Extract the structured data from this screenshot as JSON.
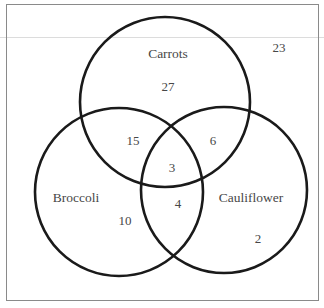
{
  "diagram": {
    "type": "venn",
    "sets": [
      {
        "name": "Carrots",
        "label": "Carrots"
      },
      {
        "name": "Broccoli",
        "label": "Broccoli"
      },
      {
        "name": "Cauliflower",
        "label": "Cauliflower"
      }
    ],
    "regions": {
      "carrots_only": "27",
      "broccoli_only": "10",
      "cauliflower_only": "2",
      "carrots_broccoli": "15",
      "carrots_cauliflower": "6",
      "broccoli_cauliflower": "4",
      "all_three": "3",
      "none": "23"
    },
    "colors": {
      "line": "#1a1a1a",
      "text": "#474747",
      "frame": "#8a8a8a"
    }
  }
}
